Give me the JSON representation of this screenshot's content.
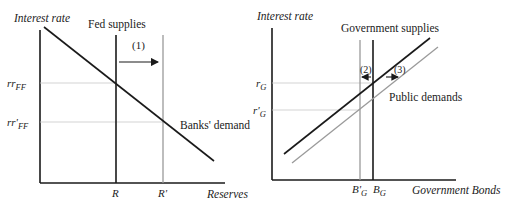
{
  "left_panel": {
    "y_axis_label": "Interest rate",
    "x_axis_label": "Reserves",
    "supply_label": "Fed supplies",
    "demand_label": "Banks' demand",
    "shift_label": "(1)",
    "rate_initial": "rr",
    "rate_initial_sub": "FF",
    "rate_new": "rr'",
    "rate_new_sub": "FF",
    "qty_initial": "R",
    "qty_new": "R'"
  },
  "right_panel": {
    "y_axis_label": "Interest rate",
    "x_axis_label": "Government Bonds",
    "supply_label": "Government supplies",
    "demand_label": "Public demands",
    "shift_label_supply": "(2)",
    "shift_label_demand": "(3)",
    "rate_initial": "r",
    "rate_initial_sub": "G",
    "rate_new": "r'",
    "rate_new_sub": "G",
    "qty_new": "B'",
    "qty_new_sub": "G",
    "qty_initial": "B",
    "qty_initial_sub": "G"
  },
  "colors": {
    "original_curve": "#1a1a1a",
    "shifted_curve": "#9a9a9a",
    "guide_line": "#c8c8c8"
  }
}
